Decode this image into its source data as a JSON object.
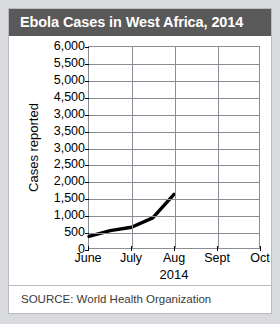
{
  "card": {
    "title": "Ebola Cases in West Africa, 2014",
    "source": "SOURCE: World Health Organization"
  },
  "colors": {
    "title_band": "#595959",
    "title_text": "#ffffff",
    "card_background": "#ffffff",
    "page_background": "#d9dade",
    "grid": "#8a8d93",
    "data_line": "#000000"
  },
  "chart_data": {
    "type": "line",
    "title": "Ebola Cases in West Africa, 2014",
    "xlabel": "2014",
    "ylabel": "Cases reported",
    "categories": [
      "June",
      "July",
      "Aug",
      "Sept",
      "Oct"
    ],
    "ytick_labels": [
      "6,000",
      "5,500",
      "5,000",
      "4,500",
      "3,000",
      "3,500",
      "3,000",
      "2,500",
      "2,000",
      "1,500",
      "1,000",
      "500",
      "0"
    ],
    "ytick_values": [
      6000,
      5500,
      5000,
      4500,
      4000,
      3500,
      3000,
      2500,
      2000,
      1500,
      1000,
      500,
      0
    ],
    "ylim": [
      0,
      6000
    ],
    "grid": true,
    "legend": "none",
    "series": [
      {
        "name": "Cases reported",
        "x": [
          "June",
          "June-mid",
          "July",
          "July-mid",
          "Aug"
        ],
        "values": [
          350,
          520,
          620,
          900,
          1600
        ]
      }
    ],
    "note": "Y-axis tick labels reproduce the printed chart exactly, including the misprinted 3,000 at the 4,000 position and 3,000 at the 3,000 position."
  }
}
